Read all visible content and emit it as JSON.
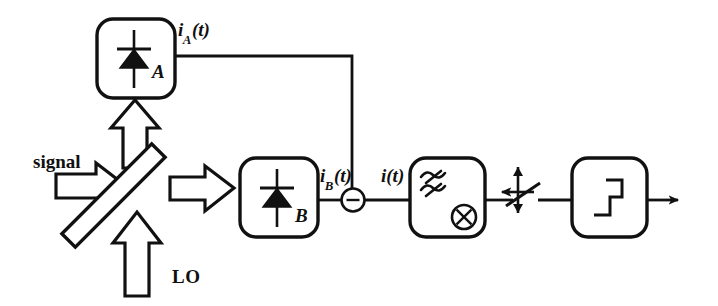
{
  "diagram": {
    "stroke_color": "#111111",
    "fill_color": "#ffffff",
    "background": "#ffffff"
  },
  "inputs": {
    "signal_label": "signal",
    "lo_label": "LO"
  },
  "optics": {
    "beam_splitter_name": "beam-splitter",
    "beam_splitter_angle_deg": -45
  },
  "detectors": [
    {
      "id": "A",
      "label": "A",
      "symbol": "photodiode"
    },
    {
      "id": "B",
      "label": "B",
      "symbol": "photodiode"
    }
  ],
  "currents": {
    "i_a": {
      "base": "i",
      "sub": "A",
      "arg": "(t)",
      "full": "iA(t)"
    },
    "i_b": {
      "base": "i",
      "sub": "B",
      "arg": "(t)",
      "full": "iB(t)"
    },
    "i_total": {
      "base": "i",
      "sub": "",
      "arg": "(t)",
      "full": "i(t)"
    }
  },
  "blocks": [
    {
      "id": "subtractor",
      "label": "-",
      "shape": "circle",
      "symbol": "minus"
    },
    {
      "id": "filter-mixer",
      "label": "",
      "shape": "rounded-rect",
      "symbols": [
        "wavy-filter",
        "circled-times"
      ]
    },
    {
      "id": "sampler",
      "label": "",
      "shape": "switch",
      "symbol": "sampling-switch"
    },
    {
      "id": "threshold",
      "label": "",
      "shape": "rounded-rect",
      "symbol": "step-function"
    }
  ],
  "output": {
    "arrow_name": "output-arrow"
  }
}
